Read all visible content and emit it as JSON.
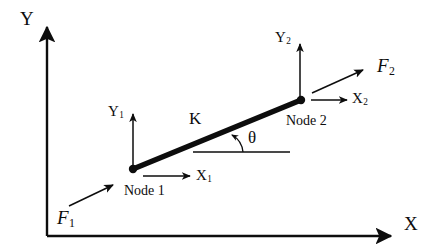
{
  "figure": {
    "kind": "engineering-diagram",
    "background_color": "#ffffff",
    "ink_color": "#0d0d0d"
  },
  "axes": {
    "y_label": "Y",
    "x_label": "X",
    "origin": {
      "x": 47,
      "y": 236
    },
    "y_tip": {
      "x": 47,
      "y": 22
    },
    "x_tip": {
      "x": 396,
      "y": 236
    }
  },
  "element": {
    "stiffness_label": "K",
    "angle_label": "θ",
    "node1": {
      "caption": "Node 1",
      "x": 133,
      "y": 169
    },
    "node2": {
      "caption": "Node 2",
      "x": 301,
      "y": 100
    }
  },
  "dofs": [
    {
      "name": "x1",
      "label_main": "X",
      "label_sub": "1"
    },
    {
      "name": "y1",
      "label_main": "Y",
      "label_sub": "1"
    },
    {
      "name": "x2",
      "label_main": "X",
      "label_sub": "2"
    },
    {
      "name": "y2",
      "label_main": "Y",
      "label_sub": "2"
    }
  ],
  "forces": [
    {
      "name": "F1",
      "label_main": "F",
      "label_sub": "1"
    },
    {
      "name": "F2",
      "label_main": "F",
      "label_sub": "2"
    }
  ]
}
